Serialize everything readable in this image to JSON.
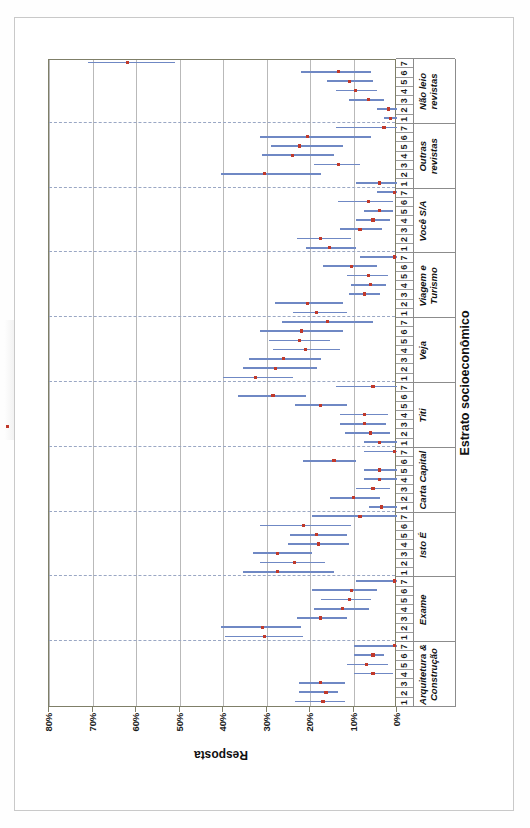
{
  "figure": {
    "yaxis": {
      "label": "Resposta",
      "ticks": [
        "80%",
        "70%",
        "60%",
        "50%",
        "40%",
        "30%",
        "20%",
        "10%",
        "0%"
      ],
      "min": 0,
      "max": 80
    },
    "xaxis": {
      "label": "Estrato socioeconômico",
      "strata": [
        "1",
        "2",
        "3",
        "4",
        "5",
        "6",
        "7"
      ]
    },
    "legend": {
      "items": [
        {
          "name": "minimo",
          "label": "Mínimo"
        },
        {
          "name": "maximo",
          "label": "Máximo"
        },
        {
          "name": "media",
          "label": "Média"
        }
      ]
    },
    "colors": {
      "range": "#6f88c4",
      "mean": "#c0392b",
      "axis": "#7f7f68",
      "grid": "#b9b9b9",
      "group_divider": "#9aa7c4"
    }
  },
  "chart_data": {
    "type": "line",
    "title": "",
    "subtitle": "",
    "xlabel": "Estrato socioeconômico",
    "ylabel": "Resposta",
    "ylim": [
      0,
      80
    ],
    "yticks": [
      0,
      10,
      20,
      30,
      40,
      50,
      60,
      70,
      80
    ],
    "grid": true,
    "legend_position": "top-right",
    "legend_entries": [
      "Mínimo",
      "Máximo",
      "Média"
    ],
    "categories": [
      "Arquitetura & Construção",
      "Exame",
      "Isto É",
      "Carta Capital",
      "Titi",
      "Veja",
      "Viagem e Turismo",
      "Você S/A",
      "Outras revistas",
      "Não leio revistas"
    ],
    "strata": [
      1,
      2,
      3,
      4,
      5,
      6,
      7
    ],
    "groups": [
      {
        "category": "Arquitetura & Construção",
        "points": [
          {
            "stratum": 1,
            "min": 12.0,
            "mean": 17.0,
            "max": 23.5
          },
          {
            "stratum": 2,
            "min": 13.5,
            "mean": 16.3,
            "max": 22.5
          },
          {
            "stratum": 3,
            "min": 12.0,
            "mean": 17.5,
            "max": 22.5
          },
          {
            "stratum": 4,
            "min": 1.0,
            "mean": 5.5,
            "max": 10.0
          },
          {
            "stratum": 5,
            "min": 2.0,
            "mean": 7.0,
            "max": 11.5
          },
          {
            "stratum": 6,
            "min": 3.0,
            "mean": 5.5,
            "max": 10.0
          },
          {
            "stratum": 7,
            "min": 0.0,
            "mean": 0.5,
            "max": 10.0
          }
        ]
      },
      {
        "category": "Exame",
        "points": [
          {
            "stratum": 1,
            "min": 21.5,
            "mean": 30.5,
            "max": 39.5
          },
          {
            "stratum": 2,
            "min": 22.0,
            "mean": 31.0,
            "max": 40.5
          },
          {
            "stratum": 3,
            "min": 11.5,
            "mean": 17.5,
            "max": 23.0
          },
          {
            "stratum": 4,
            "min": 6.5,
            "mean": 12.5,
            "max": 19.0
          },
          {
            "stratum": 5,
            "min": 6.0,
            "mean": 11.0,
            "max": 17.5
          },
          {
            "stratum": 6,
            "min": 4.5,
            "mean": 10.5,
            "max": 19.5
          },
          {
            "stratum": 7,
            "min": 0.0,
            "mean": 0.5,
            "max": 9.5
          }
        ]
      },
      {
        "category": "Isto É",
        "points": [
          {
            "stratum": 1,
            "min": 14.5,
            "mean": 27.5,
            "max": 35.5
          },
          {
            "stratum": 2,
            "min": 16.5,
            "mean": 23.5,
            "max": 31.5
          },
          {
            "stratum": 3,
            "min": 19.5,
            "mean": 27.5,
            "max": 33.0
          },
          {
            "stratum": 4,
            "min": 11.0,
            "mean": 18.0,
            "max": 25.0
          },
          {
            "stratum": 5,
            "min": 11.5,
            "mean": 18.5,
            "max": 24.5
          },
          {
            "stratum": 6,
            "min": 10.5,
            "mean": 21.5,
            "max": 31.5
          },
          {
            "stratum": 7,
            "min": 0.0,
            "mean": 8.5,
            "max": 19.5
          }
        ]
      },
      {
        "category": "Carta Capital",
        "points": [
          {
            "stratum": 1,
            "min": 0.0,
            "mean": 3.5,
            "max": 6.5
          },
          {
            "stratum": 2,
            "min": 4.0,
            "mean": 10.0,
            "max": 15.5
          },
          {
            "stratum": 3,
            "min": 1.5,
            "mean": 5.5,
            "max": 9.5
          },
          {
            "stratum": 4,
            "min": 0.0,
            "mean": 4.0,
            "max": 7.5
          },
          {
            "stratum": 5,
            "min": 0.0,
            "mean": 4.0,
            "max": 7.5
          },
          {
            "stratum": 6,
            "min": 9.5,
            "mean": 14.5,
            "max": 21.5
          },
          {
            "stratum": 7,
            "min": 0.0,
            "mean": 0.5,
            "max": 7.5
          }
        ]
      },
      {
        "category": "Titi",
        "points": [
          {
            "stratum": 1,
            "min": 0.0,
            "mean": 4.0,
            "max": 7.5
          },
          {
            "stratum": 2,
            "min": 1.5,
            "mean": 6.0,
            "max": 12.0
          },
          {
            "stratum": 3,
            "min": 2.5,
            "mean": 7.5,
            "max": 13.0
          },
          {
            "stratum": 4,
            "min": 2.0,
            "mean": 7.5,
            "max": 13.0
          },
          {
            "stratum": 5,
            "min": 11.5,
            "mean": 17.5,
            "max": 23.5
          },
          {
            "stratum": 6,
            "min": 21.0,
            "mean": 28.5,
            "max": 36.5
          },
          {
            "stratum": 7,
            "min": 0.0,
            "mean": 5.5,
            "max": 14.0
          }
        ]
      },
      {
        "category": "Veja",
        "points": [
          {
            "stratum": 1,
            "min": 24.0,
            "mean": 32.5,
            "max": 40.0
          },
          {
            "stratum": 2,
            "min": 18.5,
            "mean": 28.0,
            "max": 35.5
          },
          {
            "stratum": 3,
            "min": 17.5,
            "mean": 26.0,
            "max": 34.0
          },
          {
            "stratum": 4,
            "min": 13.0,
            "mean": 21.0,
            "max": 28.5
          },
          {
            "stratum": 5,
            "min": 15.5,
            "mean": 22.5,
            "max": 29.5
          },
          {
            "stratum": 6,
            "min": 12.5,
            "mean": 22.0,
            "max": 31.5
          },
          {
            "stratum": 7,
            "min": 5.5,
            "mean": 16.0,
            "max": 26.5
          }
        ]
      },
      {
        "category": "Viagem e Turismo",
        "points": [
          {
            "stratum": 1,
            "min": 11.5,
            "mean": 18.5,
            "max": 24.0
          },
          {
            "stratum": 2,
            "min": 12.5,
            "mean": 20.5,
            "max": 28.0
          },
          {
            "stratum": 3,
            "min": 4.0,
            "mean": 7.5,
            "max": 11.0
          },
          {
            "stratum": 4,
            "min": 2.5,
            "mean": 6.0,
            "max": 10.5
          },
          {
            "stratum": 5,
            "min": 2.0,
            "mean": 6.5,
            "max": 11.5
          },
          {
            "stratum": 6,
            "min": 4.5,
            "mean": 10.5,
            "max": 17.0
          },
          {
            "stratum": 7,
            "min": 0.0,
            "mean": 0.5,
            "max": 8.5
          }
        ]
      },
      {
        "category": "Você S/A",
        "points": [
          {
            "stratum": 1,
            "min": 9.5,
            "mean": 15.5,
            "max": 21.0
          },
          {
            "stratum": 2,
            "min": 10.5,
            "mean": 17.5,
            "max": 23.0
          },
          {
            "stratum": 3,
            "min": 3.5,
            "mean": 8.5,
            "max": 13.0
          },
          {
            "stratum": 4,
            "min": 1.5,
            "mean": 5.5,
            "max": 9.5
          },
          {
            "stratum": 5,
            "min": 1.0,
            "mean": 4.0,
            "max": 7.5
          },
          {
            "stratum": 6,
            "min": 1.0,
            "mean": 6.5,
            "max": 13.5
          },
          {
            "stratum": 7,
            "min": 0.0,
            "mean": 0.5,
            "max": 4.5
          }
        ]
      },
      {
        "category": "Outras revistas",
        "points": [
          {
            "stratum": 1,
            "min": 0.0,
            "mean": 4.0,
            "max": 9.5
          },
          {
            "stratum": 2,
            "min": 17.5,
            "mean": 30.5,
            "max": 40.5
          },
          {
            "stratum": 3,
            "min": 8.5,
            "mean": 13.5,
            "max": 19.0
          },
          {
            "stratum": 4,
            "min": 14.5,
            "mean": 24.0,
            "max": 31.0
          },
          {
            "stratum": 5,
            "min": 12.5,
            "mean": 22.5,
            "max": 29.0
          },
          {
            "stratum": 6,
            "min": 6.0,
            "mean": 20.5,
            "max": 31.5
          },
          {
            "stratum": 7,
            "min": 0.0,
            "mean": 3.0,
            "max": 14.0
          }
        ]
      },
      {
        "category": "Não leio revistas",
        "points": [
          {
            "stratum": 1,
            "min": 0.0,
            "mean": 1.5,
            "max": 3.0
          },
          {
            "stratum": 2,
            "min": 0.0,
            "mean": 2.0,
            "max": 4.5
          },
          {
            "stratum": 3,
            "min": 3.0,
            "mean": 6.5,
            "max": 11.0
          },
          {
            "stratum": 4,
            "min": 4.5,
            "mean": 9.5,
            "max": 14.0
          },
          {
            "stratum": 5,
            "min": 5.5,
            "mean": 11.0,
            "max": 16.0
          },
          {
            "stratum": 6,
            "min": 6.0,
            "mean": 13.5,
            "max": 22.0
          },
          {
            "stratum": 7,
            "min": 51.0,
            "mean": 62.0,
            "max": 71.0
          }
        ]
      }
    ]
  }
}
